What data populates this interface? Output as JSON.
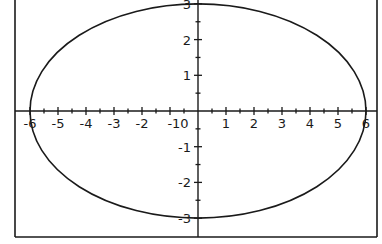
{
  "chart_data": {
    "type": "line",
    "title": "",
    "xlabel": "",
    "ylabel": "",
    "equation": "x^2/36 + y^2/9 = 1",
    "series": [
      {
        "name": "ellipse",
        "center": [
          0,
          0
        ],
        "semi_axis_x": 6,
        "semi_axis_y": 3,
        "points": [
          [
            6,
            0
          ],
          [
            5,
            1.658
          ],
          [
            4,
            2.236
          ],
          [
            3,
            2.598
          ],
          [
            2,
            2.828
          ],
          [
            1,
            2.958
          ],
          [
            0,
            3
          ],
          [
            -1,
            2.958
          ],
          [
            -2,
            2.828
          ],
          [
            -3,
            2.598
          ],
          [
            -4,
            2.236
          ],
          [
            -5,
            1.658
          ],
          [
            -6,
            0
          ],
          [
            -5,
            -1.658
          ],
          [
            -4,
            -2.236
          ],
          [
            -3,
            -2.598
          ],
          [
            -2,
            -2.828
          ],
          [
            -1,
            -2.958
          ],
          [
            0,
            -3
          ],
          [
            1,
            -2.958
          ],
          [
            2,
            -2.828
          ],
          [
            3,
            -2.598
          ],
          [
            4,
            -2.236
          ],
          [
            5,
            -1.658
          ],
          [
            6,
            0
          ]
        ]
      }
    ],
    "x_ticks": [
      "-6",
      "-5",
      "-4",
      "-3",
      "-2",
      "-1",
      "0",
      "1",
      "2",
      "3",
      "4",
      "5",
      "6"
    ],
    "y_ticks": [
      "3",
      "2",
      "1",
      "-1",
      "-2",
      "-3"
    ],
    "xlim": [
      -6.5,
      6.4
    ],
    "ylim": [
      -3.5,
      3.1
    ],
    "minor_tick_step": 0.5,
    "grid": false,
    "legend": "none"
  },
  "labels": {
    "x_neg": [
      "-6",
      "-5",
      "-4",
      "-3",
      "-2",
      "-10"
    ],
    "x_pos": [
      "1",
      "2",
      "3",
      "4",
      "5",
      "6"
    ],
    "y_pos": [
      "3",
      "2",
      "1"
    ],
    "y_neg": [
      "-1",
      "-2",
      "-3"
    ]
  },
  "colors": {
    "ink": "#1a1a1a",
    "background": "#ffffff"
  }
}
